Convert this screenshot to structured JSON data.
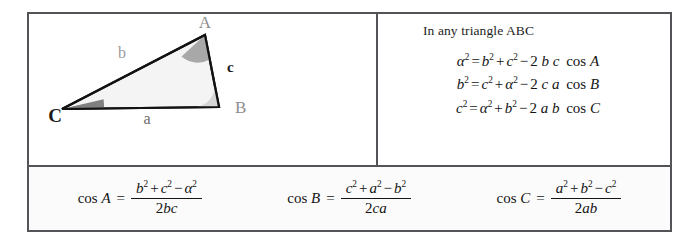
{
  "figure": {
    "background_color": "#ffffff",
    "border_color": "#545458"
  },
  "diagram": {
    "name": "labelled triangle ABC",
    "vertices": [
      {
        "id": "A",
        "label": "A",
        "x": 203,
        "y": 48,
        "label_x": 203,
        "label_y": 26,
        "label_color": "#8e8e8e",
        "bold": false
      },
      {
        "id": "B",
        "label": "B",
        "x": 217,
        "y": 120,
        "label_x": 233,
        "label_y": 124,
        "label_color": "#8e8e8e",
        "bold": false
      },
      {
        "id": "C",
        "label": "C",
        "x": 60,
        "y": 122,
        "label_x": 44,
        "label_y": 131,
        "label_color": "#1a1a1a",
        "bold": true
      }
    ],
    "sides": [
      {
        "id": "a",
        "label": "a",
        "from": "C",
        "to": "B",
        "label_x": 145,
        "label_y": 134,
        "label_color": "#6e6e6e",
        "bold": false
      },
      {
        "id": "b",
        "label": "b",
        "from": "C",
        "to": "A",
        "label_x": 120,
        "label_y": 67,
        "label_color": "#9a9a9a",
        "bold": false
      },
      {
        "id": "c",
        "label": "c",
        "from": "A",
        "to": "B",
        "label_x": 225,
        "label_y": 81,
        "label_color": "#1a1a1a",
        "bold": true
      }
    ],
    "angles": [
      {
        "at": "A",
        "fill": "#a8a8a8",
        "radius": 25
      },
      {
        "at": "B",
        "fill": "#d6d6d6",
        "radius": 22
      },
      {
        "at": "C",
        "fill": "#808080",
        "radius": 42
      }
    ],
    "triangle_fill": "#f4f4f4",
    "triangle_stroke": "#121212"
  },
  "formulas_panel": {
    "caption": "In any triangle ABC",
    "equations": [
      {
        "id": "law-of-cosines-a",
        "plain": "α² = b² + c² − 2 b c cos A",
        "lhs_var": "α",
        "lhs_exp": "2",
        "t1_var": "b",
        "t1_exp": "2",
        "t2_var": "c",
        "t2_exp": "2",
        "coef": "2",
        "p1": "b",
        "p2": "c",
        "fn": "cos",
        "fn_arg": "A"
      },
      {
        "id": "law-of-cosines-b",
        "plain": "b² = c² + α² − 2 c a cos B",
        "lhs_var": "b",
        "lhs_exp": "2",
        "t1_var": "c",
        "t1_exp": "2",
        "t2_var": "α",
        "t2_exp": "2",
        "coef": "2",
        "p1": "c",
        "p2": "a",
        "fn": "cos",
        "fn_arg": "B"
      },
      {
        "id": "law-of-cosines-c",
        "plain": "c² = α² + b² − 2 a b cos C",
        "lhs_var": "c",
        "lhs_exp": "2",
        "t1_var": "α",
        "t1_exp": "2",
        "t2_var": "b",
        "t2_exp": "2",
        "coef": "2",
        "p1": "a",
        "p2": "b",
        "fn": "cos",
        "fn_arg": "C"
      }
    ]
  },
  "cosine_row": {
    "items": [
      {
        "id": "cos-A",
        "plain": "cos A = (b² + c² − α²) / 2bc",
        "fn": "cos",
        "arg": "A",
        "eq": "=",
        "n1_var": "b",
        "n1_exp": "2",
        "n2_var": "c",
        "n2_exp": "2",
        "n3_var": "α",
        "n3_exp": "2",
        "den": "2bc",
        "den_coef": "2",
        "den_vars": "bc"
      },
      {
        "id": "cos-B",
        "plain": "cos B = (c² + a² − b²) / 2ca",
        "fn": "cos",
        "arg": "B",
        "eq": "=",
        "n1_var": "c",
        "n1_exp": "2",
        "n2_var": "a",
        "n2_exp": "2",
        "n3_var": "b",
        "n3_exp": "2",
        "den": "2ca",
        "den_coef": "2",
        "den_vars": "ca"
      },
      {
        "id": "cos-C",
        "plain": "cos C = (a² + b² − c²) / 2ab",
        "fn": "cos",
        "arg": "C",
        "eq": "=",
        "n1_var": "a",
        "n1_exp": "2",
        "n2_var": "b",
        "n2_exp": "2",
        "n3_var": "c",
        "n3_exp": "2",
        "den": "2ab",
        "den_coef": "2",
        "den_vars": "ab"
      }
    ],
    "operators": {
      "plus": "+",
      "minus": "−",
      "equals": "="
    }
  }
}
